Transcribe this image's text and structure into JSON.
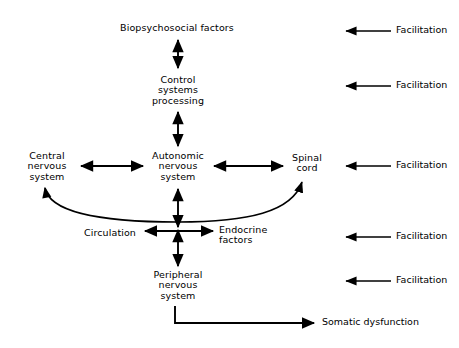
{
  "figure": {
    "background_color": "#ffffff",
    "ink_color": "#000000"
  },
  "nodes": {
    "biopsychosocial": {
      "label": "Biopsychosocial factors",
      "x": 177,
      "y": 28
    },
    "control_systems": {
      "label": "Control\nsystems\nprocessing",
      "x": 178,
      "y": 88
    },
    "central_nervous": {
      "label": "Central\nnervous\nsystem",
      "x": 47,
      "y": 165
    },
    "autonomic_nervous": {
      "label": "Autonomic\nnervous\nsystem",
      "x": 178,
      "y": 165
    },
    "spinal_cord": {
      "label": "Spinal\ncord",
      "x": 306,
      "y": 163
    },
    "circulation": {
      "label": "Circulation",
      "x": 110,
      "y": 233
    },
    "endocrine_factors": {
      "label": "Endocrine\nfactors",
      "x": 236,
      "y": 235
    },
    "peripheral_nervous": {
      "label": "Peripheral\nnervous\nsystem",
      "x": 178,
      "y": 283
    },
    "somatic_dysfunction": {
      "label": "Somatic dysfunction",
      "x": 322,
      "y": 323
    }
  },
  "side_annotations": {
    "label": "Facilitation",
    "items": [
      {
        "label": "Facilitation",
        "y": 31
      },
      {
        "label": "Facilitation",
        "y": 86
      },
      {
        "label": "Facilitation",
        "y": 166
      },
      {
        "label": "Facilitation",
        "y": 237
      },
      {
        "label": "Facilitation",
        "y": 281
      }
    ]
  },
  "connections": [
    {
      "name": "biopsychosocial-to-control",
      "type": "double-vertical"
    },
    {
      "name": "control-to-autonomic",
      "type": "double-vertical"
    },
    {
      "name": "central-to-autonomic",
      "type": "double-horizontal"
    },
    {
      "name": "autonomic-to-spinal",
      "type": "double-horizontal"
    },
    {
      "name": "autonomic-to-peripheral",
      "type": "double-vertical"
    },
    {
      "name": "circulation-to-endocrine",
      "type": "double-horizontal"
    },
    {
      "name": "circulation-arc-to-central-and-spinal",
      "type": "curved-double"
    },
    {
      "name": "peripheral-to-somatic-dysfunction",
      "type": "elbow-single"
    }
  ]
}
